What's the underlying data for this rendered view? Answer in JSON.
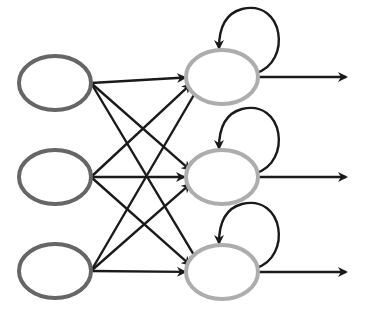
{
  "diagram": {
    "type": "recurrent-neural-network",
    "colors": {
      "input_node_stroke": "#666666",
      "hidden_node_stroke": "#adadad",
      "edge": "#1a1a1a",
      "background": "#ffffff"
    },
    "layers": [
      {
        "name": "input",
        "nodes": [
          "x1",
          "x2",
          "x3"
        ]
      },
      {
        "name": "hidden",
        "nodes": [
          "h1",
          "h2",
          "h3"
        ]
      }
    ],
    "edges": [
      {
        "from": "x1",
        "to": "h1"
      },
      {
        "from": "x1",
        "to": "h2"
      },
      {
        "from": "x1",
        "to": "h3"
      },
      {
        "from": "x2",
        "to": "h1"
      },
      {
        "from": "x2",
        "to": "h2"
      },
      {
        "from": "x2",
        "to": "h3"
      },
      {
        "from": "x3",
        "to": "h1"
      },
      {
        "from": "x3",
        "to": "h2"
      },
      {
        "from": "x3",
        "to": "h3"
      }
    ],
    "self_loops": [
      "h1",
      "h2",
      "h3"
    ],
    "outputs": [
      "h1",
      "h2",
      "h3"
    ]
  }
}
